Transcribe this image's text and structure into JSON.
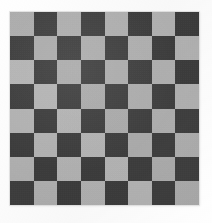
{
  "image": {
    "subject": "checkerboard",
    "description": "8 by 8 checkerboard pattern photograph",
    "background_color": "#ffffff",
    "alt_text": "Checkerboard"
  },
  "board": {
    "rows": 8,
    "columns": 8,
    "light_color": "#b4b4b4",
    "dark_color": "#3b3b3b",
    "top_left_square": "light",
    "left_px": 10,
    "top_px": 12,
    "width_px": 189,
    "height_px": 193,
    "square_size_px": 24,
    "grid": [
      [
        "light",
        "dark",
        "light",
        "dark",
        "light",
        "dark",
        "light",
        "dark"
      ],
      [
        "dark",
        "light",
        "dark",
        "light",
        "dark",
        "light",
        "dark",
        "light"
      ],
      [
        "light",
        "dark",
        "light",
        "dark",
        "light",
        "dark",
        "light",
        "dark"
      ],
      [
        "dark",
        "light",
        "dark",
        "light",
        "dark",
        "light",
        "dark",
        "light"
      ],
      [
        "light",
        "dark",
        "light",
        "dark",
        "light",
        "dark",
        "light",
        "dark"
      ],
      [
        "dark",
        "light",
        "dark",
        "light",
        "dark",
        "light",
        "dark",
        "light"
      ],
      [
        "light",
        "dark",
        "light",
        "dark",
        "light",
        "dark",
        "light",
        "dark"
      ],
      [
        "dark",
        "light",
        "dark",
        "light",
        "dark",
        "light",
        "dark",
        "light"
      ]
    ]
  }
}
